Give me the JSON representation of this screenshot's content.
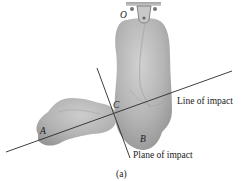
{
  "figure": {
    "caption": "(a)",
    "labels": {
      "pivot": "O",
      "body_a": "A",
      "body_b": "B",
      "contact_point": "C",
      "line_of_impact": "Line of impact",
      "plane_of_impact": "Plane of impact"
    },
    "colors": {
      "body_fill": "#b5b5b5",
      "body_shade": "#9a9a9a",
      "body_highlight": "#cfcfcf",
      "line": "#2a2a2a",
      "support": "#8a8a8a"
    }
  }
}
